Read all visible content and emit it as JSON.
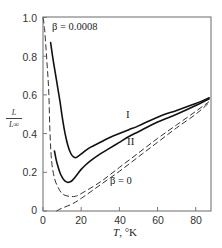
{
  "chart_data": {
    "type": "line",
    "title": "",
    "xlabel": "T, °K",
    "xlabel_var": "T",
    "xlabel_unit": ", °K",
    "ylabel": "L/L∞",
    "ylabel_num": "L",
    "ylabel_den": "L∞",
    "xlim": [
      0,
      88
    ],
    "ylim": [
      0,
      1.0
    ],
    "grid": false,
    "legend": "inline labels",
    "xticks": [
      0,
      20,
      40,
      60,
      80
    ],
    "xtick_labels": [
      "0",
      "20",
      "40",
      "60",
      "80"
    ],
    "yticks": [
      0,
      0.2,
      0.4,
      0.6,
      0.8,
      1.0
    ],
    "ytick_labels": [
      "0",
      "0.2",
      "0.4",
      "0.6",
      "0.8",
      "1.0"
    ],
    "series": [
      {
        "name": "I",
        "style": "solid",
        "x": [
          4,
          5,
          6,
          7,
          8,
          9,
          10,
          11,
          12,
          13,
          14,
          15,
          16,
          17,
          18,
          20,
          22,
          25,
          30,
          35,
          40,
          45,
          50,
          60,
          70,
          80,
          87
        ],
        "y": [
          0.87,
          0.8,
          0.74,
          0.68,
          0.62,
          0.56,
          0.49,
          0.43,
          0.38,
          0.34,
          0.31,
          0.29,
          0.28,
          0.275,
          0.28,
          0.295,
          0.31,
          0.33,
          0.355,
          0.38,
          0.4,
          0.42,
          0.44,
          0.485,
          0.52,
          0.555,
          0.585
        ]
      },
      {
        "name": "II",
        "style": "solid",
        "x": [
          6,
          7,
          8,
          9,
          10,
          11,
          12,
          13,
          14,
          15,
          16,
          18,
          20,
          22,
          25,
          30,
          35,
          40,
          45,
          50,
          60,
          70,
          80,
          87
        ],
        "y": [
          0.31,
          0.26,
          0.225,
          0.195,
          0.175,
          0.16,
          0.152,
          0.148,
          0.15,
          0.155,
          0.165,
          0.19,
          0.215,
          0.235,
          0.26,
          0.295,
          0.325,
          0.355,
          0.385,
          0.41,
          0.46,
          0.5,
          0.545,
          0.58
        ]
      },
      {
        "name": "β = 0.0008",
        "style": "dashed",
        "x": [
          0,
          0.5,
          1,
          2,
          3,
          3.6,
          4.5,
          6,
          8,
          10,
          12.5,
          15,
          17,
          20,
          30,
          40,
          50,
          60,
          70,
          80,
          87
        ],
        "y": [
          1.0,
          0.97,
          0.92,
          0.78,
          0.62,
          0.42,
          0.26,
          0.17,
          0.12,
          0.09,
          0.078,
          0.075,
          0.076,
          0.09,
          0.15,
          0.225,
          0.3,
          0.375,
          0.445,
          0.515,
          0.565
        ]
      },
      {
        "name": "β = 0",
        "style": "dashed",
        "x": [
          7,
          10,
          15,
          20,
          30,
          40,
          50,
          60,
          70,
          80,
          87
        ],
        "y": [
          0.0,
          0.015,
          0.035,
          0.065,
          0.135,
          0.205,
          0.28,
          0.355,
          0.43,
          0.5,
          0.56
        ]
      }
    ],
    "annotations": [
      {
        "text": "β = 0.0008",
        "x": 4.8,
        "y": 0.95
      },
      {
        "text": "I",
        "x": 44.5,
        "y": 0.5
      },
      {
        "text": "II",
        "x": 46,
        "y": 0.36
      },
      {
        "text": "β = 0",
        "x": 35,
        "y": 0.15
      }
    ]
  }
}
